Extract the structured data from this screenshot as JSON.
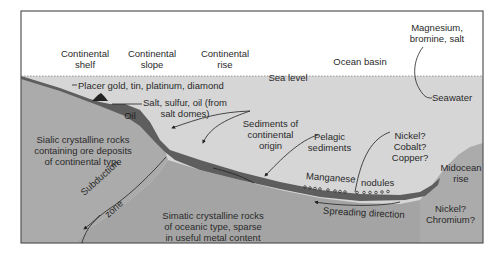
{
  "diagram": {
    "type": "cross-section",
    "colors": {
      "sky": "#ffffff",
      "ocean": "#d6d6d6",
      "rock": "#ababab",
      "sediment": "#5e5e5e",
      "frame": "#555555",
      "text": "#2a2a2a"
    },
    "zones": [
      {
        "label": "Continental\nshelf",
        "line1": "Continental",
        "line2": "shelf"
      },
      {
        "label": "Continental\nslope",
        "line1": "Continental",
        "line2": "slope"
      },
      {
        "label": "Continental\nrise",
        "line1": "Continental",
        "line2": "rise"
      },
      {
        "label": "Ocean basin",
        "line1": "Ocean basin"
      }
    ],
    "sea_level_label": "Sea level",
    "resources": {
      "magnesium": {
        "line1": "Magnesium,",
        "line2": "bromine, salt"
      },
      "seawater": "Seawater",
      "placer": "Placer gold, tin, platinum, diamond",
      "salt": {
        "line1": "Salt, sulfur, oil (from",
        "line2": "salt domes)"
      },
      "oil": "Oil",
      "sediments_continental": {
        "line1": "Sediments of",
        "line2": "continental",
        "line3": "origin"
      },
      "pelagic": {
        "line1": "Pelagic",
        "line2": "sediments"
      },
      "nickel_cobalt_copper": {
        "line1": "Nickel?",
        "line2": "Cobalt?",
        "line3": "Copper?"
      },
      "manganese": "Manganese",
      "nodules": "nodules",
      "midocean": {
        "line1": "Midocean",
        "line2": "rise"
      },
      "nickel_chromium": {
        "line1": "Nickel?",
        "line2": "Chromium?"
      }
    },
    "rocks": {
      "sialic": {
        "line1": "Sialic crystalline rocks",
        "line2": "containing ore deposits",
        "line3": "of continental type"
      },
      "simatic": {
        "line1": "Simatic crystalline rocks",
        "line2": "of oceanic type, sparse",
        "line3": "in useful metal content"
      }
    },
    "processes": {
      "subduction": "Subduction",
      "zone": "zone",
      "spreading": "Spreading direction"
    }
  }
}
